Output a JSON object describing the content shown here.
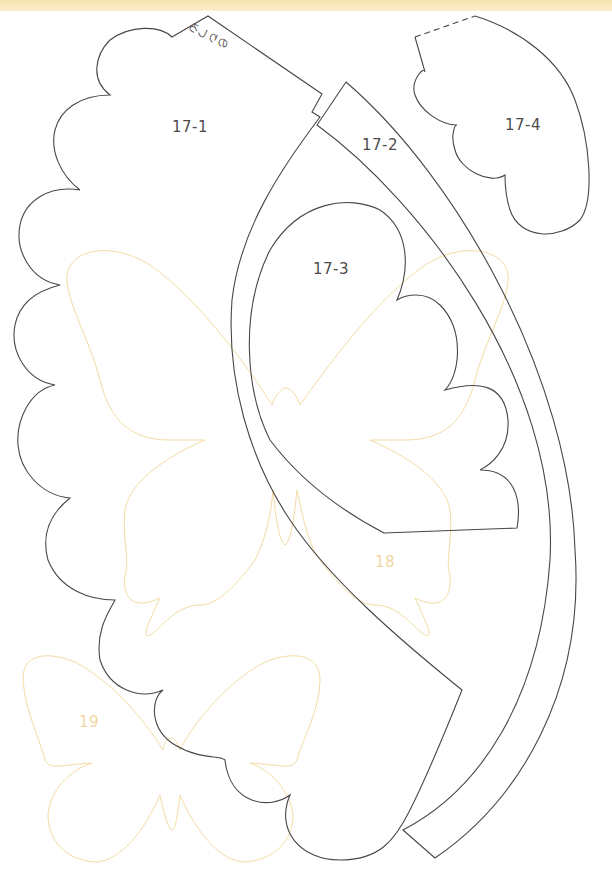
{
  "page": {
    "header_band_color": "#f7e3b0"
  },
  "pieces": [
    {
      "id": "17-1",
      "label": "17-1",
      "type": "scalloped petal",
      "glue_tab": "のりしろ"
    },
    {
      "id": "17-2",
      "label": "17-2",
      "type": "curved band"
    },
    {
      "id": "17-3",
      "label": "17-3",
      "type": "scalloped petal"
    },
    {
      "id": "17-4",
      "label": "17-4",
      "type": "scalloped leaf",
      "fold_line": "dashed"
    },
    {
      "id": "18",
      "label": "18",
      "type": "butterfly (swallowtail)",
      "color": "#f2d7a3"
    },
    {
      "id": "19",
      "label": "19",
      "type": "butterfly",
      "color": "#f2d7a3"
    }
  ],
  "colors": {
    "cut_line": "#4a4646",
    "trace_line": "#f3dca4"
  }
}
